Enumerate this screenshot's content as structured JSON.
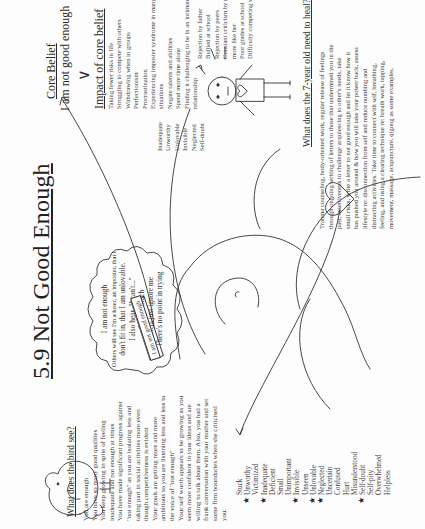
{
  "document": {
    "title": "5.9 Not Good Enough",
    "core_belief": {
      "heading": "Core Belief",
      "statement": "I am not good enough"
    },
    "impact": {
      "heading": "Impact of core belief",
      "items": [
        "Taking fewer risks in life",
        "Struggling to compete with others",
        "Withdrawing when in groups",
        "Perfectionism",
        "Procrastination",
        "Experiencing imposter syndrome in many",
        "situations",
        "Negate talents and abilities",
        "Spend more time alone",
        "Finding it challenging to be in an intimate",
        "relationship"
      ]
    },
    "thought_bubble": {
      "lines": [
        "I am not enough",
        "Others will see I'm a loser, an imposter, that I",
        "don't fit in, that I am unlovable.",
        "I also hear, \"I can't...\"",
        "It's too much",
        "Others just ignore me",
        "There's no point in trying"
      ]
    },
    "sign_text": "I am not good enough",
    "child_labels": {
      "left": [
        "Inadequate",
        "Unworthy",
        "Unlovable",
        "Invisible",
        "Neglected",
        "Self-doubt"
      ],
      "right": [
        "Rejection by father",
        "Bullied at school",
        "Rejection by peers",
        "Constant criticism by mother to be",
        "more like her",
        "Poor grades at school",
        "Difficulty competing with others"
      ]
    },
    "bird": {
      "heading": "What does the bird see?",
      "paragraph_lines": [
        "You are enough",
        "You have so many good qualities",
        "You keep growing in spite of feeling",
        "inadequate and not enough at times",
        "You have made significant progress against",
        "\"not enough\" as you are isolating less and",
        "taking part in social activities more even",
        "though competitiveness is evident",
        "Your goals are getting more and more",
        "ambitious so you are listening less and less to",
        "the voice of \"not enough\"",
        "Your self worth appears to be growing as you",
        "seem more confident in your ideas and are",
        "willing to talk about them. Also, you had a",
        "frank conversation with your mother and set",
        "some firm boundaries when she criticised",
        "you."
      ]
    },
    "feelings": [
      {
        "label": "Stuck",
        "starred": false
      },
      {
        "label": "Unworthy",
        "starred": true
      },
      {
        "label": "Victimized",
        "starred": false
      },
      {
        "label": "Inadequate",
        "starred": true
      },
      {
        "label": "Deficient",
        "starred": false
      },
      {
        "label": "Small",
        "starred": false
      },
      {
        "label": "Unimportant",
        "starred": false
      },
      {
        "label": "Invisible",
        "starred": true
      },
      {
        "label": "Unseen",
        "starred": false
      },
      {
        "label": "Unlovable",
        "starred": true
      },
      {
        "label": "Neglected",
        "starred": true
      },
      {
        "label": "Uncertain",
        "starred": false
      },
      {
        "label": "Confused",
        "starred": false
      },
      {
        "label": "Hurt",
        "starred": false
      },
      {
        "label": "Misunderstood",
        "starred": false
      },
      {
        "label": "Self-doubt",
        "starred": true
      },
      {
        "label": "Self-pity",
        "starred": false
      },
      {
        "label": "Overwhelmed",
        "starred": false
      },
      {
        "label": "Helpless",
        "starred": false
      }
    ],
    "star_glyph": "★",
    "healing": {
      "heading": "What does the 7-year old need to heal?",
      "paragraph_lines": [
        "Trauma counseling, body-oriented work, regular release of feelings",
        "through ongoing writing of letters to those that undermined you in the",
        "past, assertiveness to challenge acquiescing to other's needs, take",
        "small risks, write a letter to not good enough and let it know how it",
        "has pushed you around & how you will take your power back, assess",
        "lifestyle re: disconnection from self and reduce numbing and",
        "distracting activities. Take time to connect with self, breathing,",
        "feeling, and using a clearing technique re: breath work, tapping,",
        "movement, massage, acupuncture, qigong as some examples."
      ]
    }
  }
}
